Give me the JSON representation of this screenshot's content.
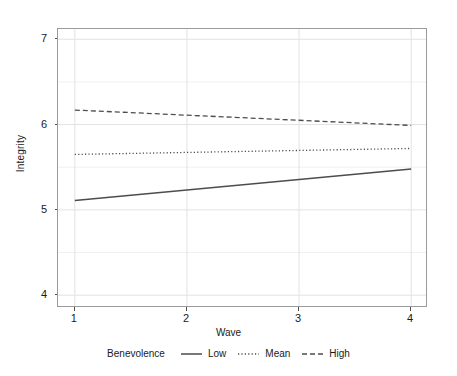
{
  "chart_data": {
    "type": "line",
    "title": "",
    "xlabel": "Wave",
    "ylabel": "Integrity",
    "xlim": [
      0.85,
      4.15
    ],
    "ylim": [
      3.85,
      7.12
    ],
    "x_ticks": [
      "1",
      "2",
      "3",
      "4"
    ],
    "x_tick_values": [
      1,
      2,
      3,
      4
    ],
    "y_ticks": [
      "4",
      "5",
      "6",
      "7"
    ],
    "y_tick_values": [
      4,
      5,
      6,
      7
    ],
    "y_minor_gridlines": [
      4.5,
      5.5,
      6.5
    ],
    "grid": true,
    "legend_position": "bottom",
    "legend_title": "Benevolence",
    "x": [
      1,
      4
    ],
    "series": [
      {
        "name": "Low",
        "style": "solid",
        "color": "#4d4d4d",
        "values": [
          5.11,
          5.48
        ]
      },
      {
        "name": "Mean",
        "style": "dotted",
        "color": "#4d4d4d",
        "values": [
          5.65,
          5.72
        ]
      },
      {
        "name": "High",
        "style": "dashed",
        "color": "#4d4d4d",
        "values": [
          6.17,
          5.99
        ]
      }
    ]
  },
  "axes": {
    "y_title": "Integrity",
    "x_title": "Wave",
    "y_tick_labels": [
      {
        "text": "7",
        "value": 7
      },
      {
        "text": "6",
        "value": 6
      },
      {
        "text": "5",
        "value": 5
      },
      {
        "text": "4",
        "value": 4
      }
    ],
    "x_tick_labels": [
      {
        "text": "1",
        "value": 1
      },
      {
        "text": "2",
        "value": 2
      },
      {
        "text": "3",
        "value": 3
      },
      {
        "text": "4",
        "value": 4
      }
    ]
  },
  "legend": {
    "title": "Benevolence",
    "items": [
      {
        "label": "Low",
        "style": "solid"
      },
      {
        "label": "Mean",
        "style": "dotted"
      },
      {
        "label": "High",
        "style": "dashed"
      }
    ]
  },
  "colors": {
    "line": "#4d4d4d",
    "panel_border": "#9a9a9a",
    "grid_major": "#e2e2e2",
    "grid_minor": "#f0f0f0",
    "background": "#ffffff",
    "text": "#1a1a1a"
  }
}
